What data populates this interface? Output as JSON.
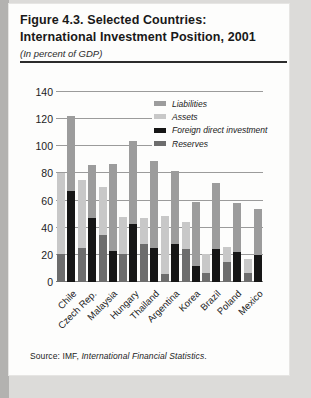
{
  "figure": {
    "title_line1": "Figure 4.3. Selected Countries:",
    "title_line2": "International Investment Position, 2001",
    "subtitle": "(In percent of GDP)"
  },
  "source": {
    "prefix": "Source: IMF, ",
    "publication": "International Financial Statistics",
    "suffix": "."
  },
  "colors": {
    "liabilities": "#9c9c9c",
    "assets": "#c8c8c8",
    "foreign_direct_investment": "#161616",
    "reserves": "#6d6d6d",
    "gridline": "#9b9b9b",
    "text": "#1c1c1c"
  },
  "chart_data": {
    "type": "bar",
    "title": "Figure 4.3. Selected Countries: International Investment Position, 2001",
    "subtitle": "(In percent of GDP)",
    "xlabel": "",
    "ylabel": "",
    "unit": "percent of GDP",
    "ylim": [
      0,
      140
    ],
    "yticks": [
      0,
      20,
      40,
      60,
      80,
      100,
      120,
      140
    ],
    "grid": true,
    "legend_position": "top-right-inside",
    "categories": [
      "Chile",
      "Czech Rep.",
      "Malaysia",
      "Hungary",
      "Thailand",
      "Argentina",
      "Korea",
      "Brazil",
      "Poland",
      "Mexico"
    ],
    "legend": [
      {
        "label": "Liabilities",
        "color_key": "liabilities"
      },
      {
        "label": "Assets",
        "color_key": "assets"
      },
      {
        "label": "Foreign direct investment",
        "color_key": "foreign_direct_investment"
      },
      {
        "label": "Reserves",
        "color_key": "reserves"
      }
    ],
    "bars_per_category": [
      {
        "bar": "external-assets",
        "segments": [
          {
            "series": "Reserves",
            "color_key": "reserves"
          },
          {
            "series": "Assets",
            "color_key": "assets"
          }
        ]
      },
      {
        "bar": "external-liabilities",
        "segments": [
          {
            "series": "Foreign direct investment",
            "color_key": "foreign_direct_investment"
          },
          {
            "series": "Liabilities",
            "color_key": "liabilities"
          }
        ]
      }
    ],
    "series": [
      {
        "name": "Reserves",
        "values": [
          21,
          25,
          35,
          21,
          28,
          6,
          24,
          7,
          15,
          7
        ]
      },
      {
        "name": "Assets",
        "values": [
          59,
          50,
          35,
          27,
          19,
          43,
          20,
          14,
          11,
          10
        ]
      },
      {
        "name": "Foreign direct investment",
        "values": [
          67,
          47,
          23,
          43,
          25,
          28,
          12,
          24,
          22,
          20
        ]
      },
      {
        "name": "Liabilities",
        "values": [
          55,
          39,
          64,
          61,
          64,
          54,
          47,
          49,
          36,
          34
        ]
      }
    ],
    "stacked_bar_totals": {
      "external_assets_bar": [
        80,
        75,
        70,
        48,
        47,
        49,
        44,
        21,
        26,
        17
      ],
      "external_liabilities_bar": [
        122,
        86,
        87,
        104,
        89,
        82,
        59,
        73,
        58,
        54
      ]
    }
  }
}
